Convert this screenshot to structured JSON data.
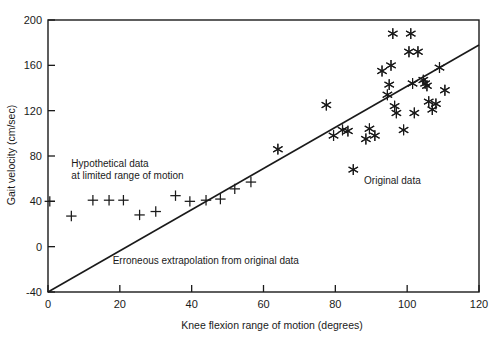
{
  "chart_data": {
    "type": "scatter",
    "title": "",
    "xlabel": "Knee flexion range of motion (degrees)",
    "ylabel": "Gait velocity (cm/sec)",
    "xlim": [
      0,
      120
    ],
    "ylim": [
      -40,
      200
    ],
    "xticks": [
      0,
      20,
      40,
      60,
      80,
      100,
      120
    ],
    "yticks": [
      -40,
      0,
      40,
      80,
      120,
      160,
      200
    ],
    "grid": false,
    "legend": "none",
    "series": [
      {
        "name": "Original data",
        "marker": "asterisk",
        "points": [
          [
            64.0,
            86.0
          ],
          [
            77.5,
            125.0
          ],
          [
            79.5,
            98.0
          ],
          [
            82.0,
            103.0
          ],
          [
            83.5,
            102.0
          ],
          [
            85.0,
            68.0
          ],
          [
            88.5,
            95.0
          ],
          [
            89.5,
            104.0
          ],
          [
            91.0,
            98.0
          ],
          [
            93.0,
            155.0
          ],
          [
            94.5,
            134.0
          ],
          [
            95.0,
            143.0
          ],
          [
            95.5,
            160.0
          ],
          [
            96.0,
            188.0
          ],
          [
            96.5,
            124.0
          ],
          [
            97.0,
            118.0
          ],
          [
            99.0,
            103.0
          ],
          [
            100.5,
            172.0
          ],
          [
            101.0,
            188.0
          ],
          [
            101.5,
            144.0
          ],
          [
            102.0,
            118.0
          ],
          [
            103.0,
            172.0
          ],
          [
            104.5,
            147.0
          ],
          [
            105.0,
            144.0
          ],
          [
            105.5,
            142.0
          ],
          [
            106.0,
            128.0
          ],
          [
            107.0,
            121.0
          ],
          [
            108.0,
            126.0
          ],
          [
            109.0,
            158.0
          ],
          [
            110.5,
            138.0
          ]
        ]
      },
      {
        "name": "Hypothetical data at limited range of motion",
        "marker": "plus",
        "points": [
          [
            0.5,
            40.0
          ],
          [
            6.5,
            27.0
          ],
          [
            12.5,
            41.0
          ],
          [
            17.0,
            41.0
          ],
          [
            21.0,
            41.0
          ],
          [
            25.5,
            28.0
          ],
          [
            30.0,
            31.0
          ],
          [
            35.5,
            45.0
          ],
          [
            39.5,
            40.0
          ],
          [
            44.0,
            41.0
          ],
          [
            48.0,
            42.0
          ],
          [
            52.0,
            51.0
          ],
          [
            56.5,
            57.0
          ]
        ]
      }
    ],
    "fit_line": {
      "name": "Erroneous extrapolation from original data",
      "x_start": 0.0,
      "y_start": -40.0,
      "x_end": 120.0,
      "y_end": 178.0
    },
    "annotations": [
      {
        "id": "hypothetical-label-line1",
        "text": "Hypothetical data",
        "x": 6.5,
        "y": 70.0
      },
      {
        "id": "hypothetical-label-line2",
        "text": "at limited range of motion",
        "x": 6.5,
        "y": 60.0
      },
      {
        "id": "original-label",
        "text": "Original data",
        "x": 88.0,
        "y": 55.0
      },
      {
        "id": "extrapolation-label",
        "text": "Erroneous extrapolation from original data",
        "x": 18.0,
        "y": -15.0
      }
    ]
  }
}
